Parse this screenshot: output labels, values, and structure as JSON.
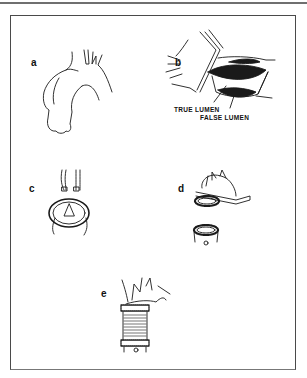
{
  "figure": {
    "panels": [
      {
        "id": "a",
        "label": "a"
      },
      {
        "id": "b",
        "label": "b",
        "annotations": [
          "TRUE LUMEN",
          "FALSE LUMEN"
        ]
      },
      {
        "id": "c",
        "label": "c"
      },
      {
        "id": "d",
        "label": "d"
      },
      {
        "id": "e",
        "label": "e"
      }
    ],
    "colors": {
      "ink": "#111111",
      "frame": "#4a4a4a",
      "rule": "#6f6f6f",
      "background": "#ffffff"
    }
  }
}
